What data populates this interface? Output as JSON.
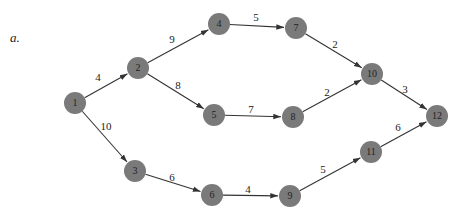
{
  "part_label": "a.",
  "colors": {
    "node_fill": "#7a7a7a",
    "edge": "#333333",
    "text": "#222222"
  },
  "node_radius": 11,
  "nodes": [
    {
      "id": "1",
      "label": "1",
      "x": 75,
      "y": 103
    },
    {
      "id": "2",
      "label": "2",
      "x": 138,
      "y": 68
    },
    {
      "id": "3",
      "label": "3",
      "x": 135,
      "y": 171
    },
    {
      "id": "4",
      "label": "4",
      "x": 219,
      "y": 24
    },
    {
      "id": "5",
      "label": "5",
      "x": 214,
      "y": 115
    },
    {
      "id": "6",
      "label": "6",
      "x": 212,
      "y": 195
    },
    {
      "id": "7",
      "label": "7",
      "x": 296,
      "y": 28
    },
    {
      "id": "8",
      "label": "8",
      "x": 293,
      "y": 117
    },
    {
      "id": "9",
      "label": "9",
      "x": 290,
      "y": 196
    },
    {
      "id": "10",
      "label": "10",
      "x": 372,
      "y": 74
    },
    {
      "id": "11",
      "label": "11",
      "x": 371,
      "y": 152
    },
    {
      "id": "12",
      "label": "12",
      "x": 437,
      "y": 116
    }
  ],
  "edges": [
    {
      "from": "1",
      "to": "2",
      "weight": "4",
      "lx": 98,
      "ly": 78
    },
    {
      "from": "1",
      "to": "3",
      "weight": "10",
      "lx": 106,
      "ly": 127
    },
    {
      "from": "2",
      "to": "4",
      "weight": "9",
      "lx": 172,
      "ly": 40
    },
    {
      "from": "2",
      "to": "5",
      "weight": "8",
      "lx": 178,
      "ly": 86
    },
    {
      "from": "4",
      "to": "7",
      "weight": "5",
      "lx": 256,
      "ly": 18
    },
    {
      "from": "5",
      "to": "8",
      "weight": "7",
      "lx": 251,
      "ly": 110
    },
    {
      "from": "3",
      "to": "6",
      "weight": "6",
      "lx": 172,
      "ly": 178
    },
    {
      "from": "6",
      "to": "9",
      "weight": "4",
      "lx": 248,
      "ly": 190
    },
    {
      "from": "7",
      "to": "10",
      "weight": "2",
      "lx": 335,
      "ly": 45
    },
    {
      "from": "8",
      "to": "10",
      "weight": "2",
      "lx": 327,
      "ly": 93
    },
    {
      "from": "9",
      "to": "11",
      "weight": "5",
      "lx": 323,
      "ly": 170
    },
    {
      "from": "10",
      "to": "12",
      "weight": "3",
      "lx": 405,
      "ly": 90
    },
    {
      "from": "11",
      "to": "12",
      "weight": "6",
      "lx": 398,
      "ly": 128
    }
  ]
}
